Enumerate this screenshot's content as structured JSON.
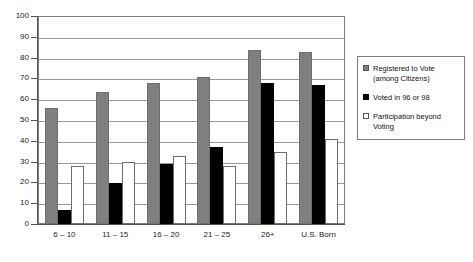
{
  "chart_data": {
    "type": "bar",
    "title": "",
    "xlabel": "",
    "ylabel": "",
    "ylim": [
      0,
      100
    ],
    "ytick_step": 10,
    "grid": true,
    "legend_position": "right",
    "categories": [
      "6 – 10",
      "11 – 15",
      "16 – 20",
      "21 – 25",
      "26+",
      "U.S. Born"
    ],
    "ytick_labels": [
      "100",
      "90",
      "80",
      "70",
      "60",
      "50",
      "40",
      "30",
      "20",
      "10",
      "0"
    ],
    "series": [
      {
        "name": "Registered to Vote (among Citizens)",
        "legend_line1": "Registered to Vote",
        "legend_line2": "(among Citizens)",
        "color": "#808080",
        "swatch": "registered",
        "values": [
          56,
          64,
          68,
          71,
          84,
          83
        ]
      },
      {
        "name": "Voted in 96 or 98",
        "legend_line1": "Voted in 96 or 98",
        "legend_line2": "",
        "color": "#000000",
        "swatch": "voted",
        "values": [
          7,
          20,
          29,
          37,
          68,
          67
        ]
      },
      {
        "name": "Participation beyond Voting",
        "legend_line1": "Participation beyond",
        "legend_line2": "Voting",
        "color": "#ffffff",
        "swatch": "participation",
        "values": [
          28,
          30,
          33,
          28,
          35,
          41
        ]
      }
    ]
  }
}
